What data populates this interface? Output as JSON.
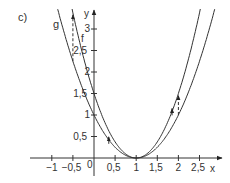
{
  "part_label": "c)",
  "axes": {
    "x_label": "x",
    "y_label": "y",
    "origin_label": "0",
    "x_ticks": [
      {
        "value": -1,
        "label": "−1"
      },
      {
        "value": -0.5,
        "label": "−0,5"
      },
      {
        "value": 0.5,
        "label": "0,5"
      },
      {
        "value": 1,
        "label": "1"
      },
      {
        "value": 1.5,
        "label": "1,5"
      },
      {
        "value": 2,
        "label": "2"
      },
      {
        "value": 2.5,
        "label": "2,5"
      }
    ],
    "y_ticks": [
      {
        "value": 0.5,
        "label": "0,5"
      },
      {
        "value": 1,
        "label": "1"
      },
      {
        "value": 1.5,
        "label": "1,5"
      },
      {
        "value": 2,
        "label": "2"
      },
      {
        "value": 2.5,
        "label": "2,5"
      },
      {
        "value": 3,
        "label": "3"
      }
    ]
  },
  "curves": [
    {
      "name": "f",
      "label": "f",
      "formula": "(x-1)^2",
      "a": 1
    },
    {
      "name": "g",
      "label": "g",
      "formula": "1.5(x-1)^2",
      "a": 1.5
    }
  ],
  "dashed_arrows": [
    {
      "x": -0.5,
      "from_curve": "f",
      "to_curve": "g"
    },
    {
      "x": 2,
      "from_curve": "f",
      "to_curve": "g"
    }
  ],
  "colors": {
    "stroke": "#333333",
    "text": "#333333"
  }
}
